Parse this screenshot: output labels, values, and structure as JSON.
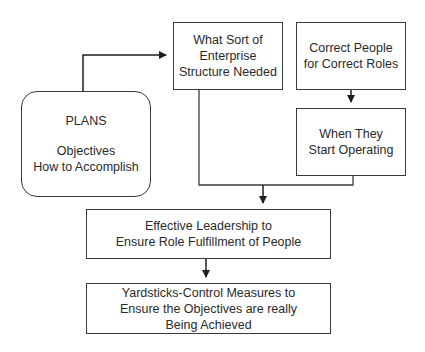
{
  "diagram": {
    "colors": {
      "stroke": "#3a3a3a",
      "text": "#2a2a2a",
      "background": "#ffffff"
    },
    "nodes": {
      "plans": {
        "title": "PLANS",
        "lines": [
          "Objectives",
          "How to Accomplish"
        ],
        "shape": "rounded-rectangle"
      },
      "structure": {
        "lines": [
          "What Sort of",
          "Enterprise",
          "Structure Needed"
        ],
        "shape": "rectangle"
      },
      "people": {
        "lines": [
          "Correct People",
          "for Correct Roles"
        ],
        "shape": "rectangle"
      },
      "operating": {
        "lines": [
          "When They",
          "Start Operating"
        ],
        "shape": "rectangle"
      },
      "leadership": {
        "lines": [
          "Effective Leadership to",
          "Ensure Role Fulfillment of People"
        ],
        "shape": "rectangle"
      },
      "yardsticks": {
        "lines": [
          "Yardsticks-Control Measures to",
          "Ensure the Objectives are really",
          "Being Achieved"
        ],
        "shape": "rectangle"
      }
    },
    "edges": [
      {
        "from": "plans",
        "to": "structure",
        "arrow": true
      },
      {
        "from": "people",
        "to": "operating",
        "arrow": true
      },
      {
        "from": "structure",
        "to": "leadership",
        "arrow": true,
        "merge_with": "operating"
      },
      {
        "from": "leadership",
        "to": "yardsticks",
        "arrow": true
      }
    ]
  }
}
